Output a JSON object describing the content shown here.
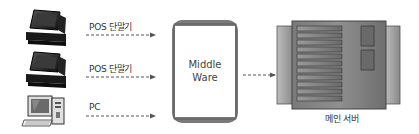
{
  "diagram": {
    "type": "system-architecture",
    "clients": [
      {
        "id": "pos1",
        "label": "POS 단말기",
        "icon": "pos-terminal-icon"
      },
      {
        "id": "pos2",
        "label": "POS 단말기",
        "icon": "pos-terminal-icon"
      },
      {
        "id": "pc",
        "label": "PC",
        "icon": "desktop-pc-icon"
      }
    ],
    "middleware": {
      "line1": "Middle",
      "line2": "Ware"
    },
    "server": {
      "label": "메인 서버",
      "icon": "server-rack-icon"
    },
    "edges": [
      {
        "from": "pos1",
        "to": "middleware",
        "style": "dashed-arrow"
      },
      {
        "from": "pos2",
        "to": "middleware",
        "style": "dashed-arrow"
      },
      {
        "from": "pc",
        "to": "middleware",
        "style": "dashed-arrow"
      },
      {
        "from": "middleware",
        "to": "server",
        "style": "dashed-arrow"
      }
    ],
    "colors": {
      "line": "#555555",
      "box_border": "#666666",
      "server_dark": "#5a5a5a",
      "server_mid": "#8a8a8a",
      "terminal": "#1a1a1a"
    }
  }
}
